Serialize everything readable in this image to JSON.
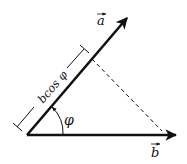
{
  "diagram": {
    "type": "vector-projection",
    "vector_a": {
      "label": "a",
      "has_arrow_accent": true
    },
    "vector_b": {
      "label": "b",
      "has_arrow_accent": true
    },
    "angle": {
      "label": "φ"
    },
    "projection": {
      "label": "bcos φ"
    },
    "colors": {
      "stroke": "#111111",
      "background": "#ffffff"
    }
  }
}
